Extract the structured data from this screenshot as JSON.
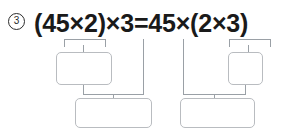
{
  "problem": {
    "number": "3",
    "marker_style": "circled"
  },
  "equation": {
    "lhs": "(45×2)×3",
    "relation": "=",
    "rhs": "45×(2×3)",
    "full": "(45×2)×3=45×(2×3)"
  },
  "left_group": {
    "bracket_label": "45×2",
    "upper_box_value": "",
    "drop_line_label": "3",
    "lower_box_value": ""
  },
  "right_group": {
    "bracket_label": "2×3",
    "upper_box_value": "",
    "drop_line_label": "45",
    "lower_box_value": ""
  },
  "colors": {
    "text": "#1a1a1a",
    "marker": "#2b2b2b",
    "line": "#9aa0a6",
    "box_border": "#b9bcc0",
    "background": "#ffffff"
  }
}
